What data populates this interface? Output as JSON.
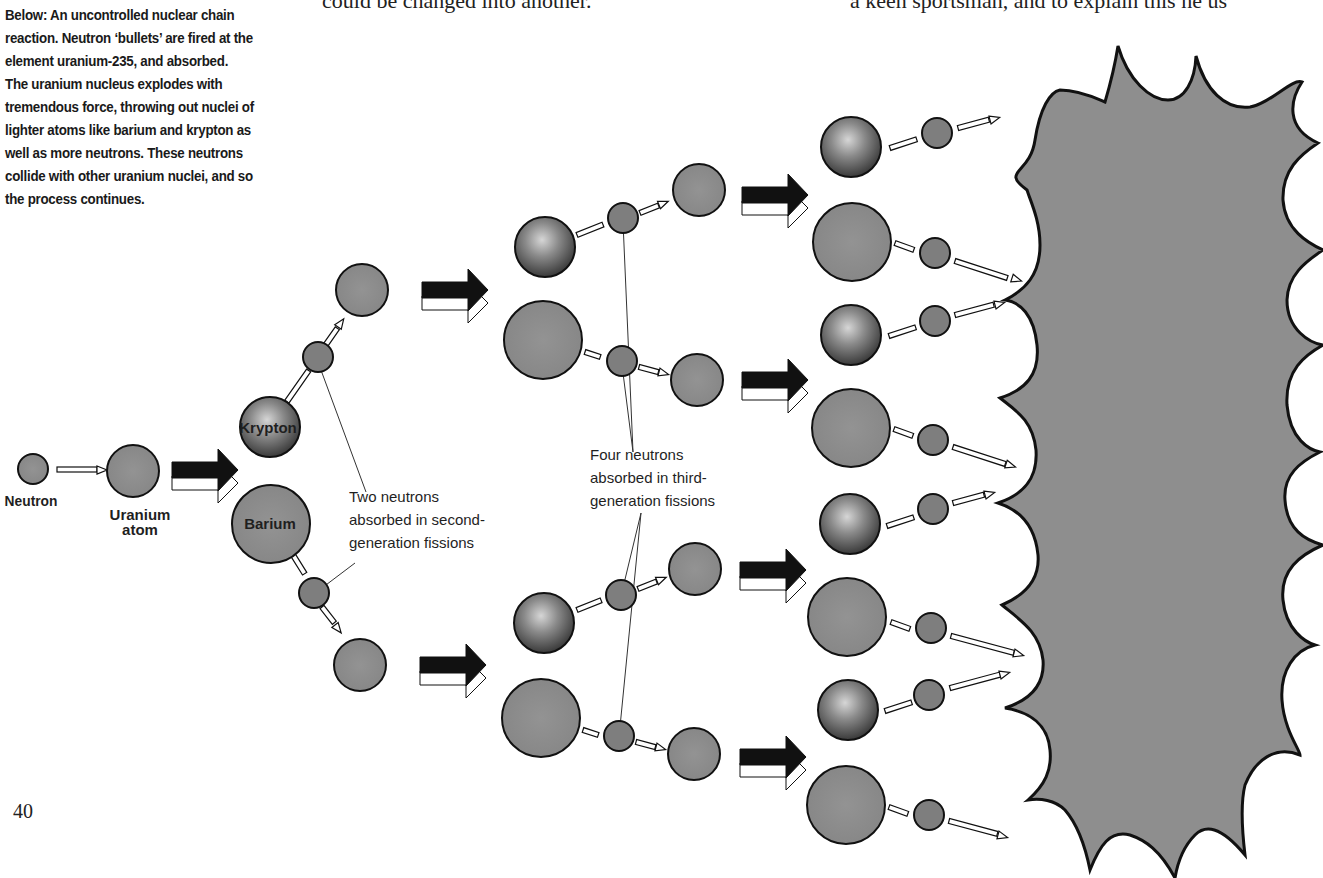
{
  "page": {
    "top_text_left": "could be changed into another.",
    "top_text_right": "a keen sportsman, and to explain this he us",
    "page_number": "40"
  },
  "caption": {
    "text": "Below: An uncontrolled nuclear chain reaction. Neutron ‘bullets’ are fired at the element uranium-235, and absorbed. The uranium nucleus explodes with tremendous force, throwing out nuclei of lighter atoms like barium and krypton as well as more neutrons. These neutrons collide with other uranium nuclei, and so the process continues."
  },
  "labels": {
    "neutron": "Neutron",
    "uranium_line1": "Uranium",
    "uranium_line2": "atom",
    "krypton": "Krypton",
    "barium": "Barium",
    "second_gen_line1": "Two neutrons",
    "second_gen_line2": "absorbed in second-",
    "second_gen_line3": "generation fissions",
    "third_gen_line1": "Four neutrons",
    "third_gen_line2": "absorbed in third-",
    "third_gen_line3": "generation fissions"
  },
  "colors": {
    "nucleus_fill": "#8c8c8c",
    "neutron_fill": "#7e7e7e",
    "outline": "#1a1a1a",
    "big_arrow": "#111111",
    "explosion_fill": "#8e8e8e",
    "background": "#ffffff"
  },
  "diagram": {
    "generation_1": {
      "neutron": {
        "cx": 33,
        "cy": 469,
        "r": 15
      },
      "uranium": {
        "cx": 133,
        "cy": 471,
        "r": 26
      },
      "arrow": {
        "x1": 57,
        "y1": 470,
        "x2": 106,
        "y2": 472
      }
    },
    "generation_2": {
      "krypton": {
        "cx": 270,
        "cy": 427,
        "r": 30
      },
      "barium": {
        "cx": 271,
        "cy": 524,
        "r": 39
      },
      "neutrons": [
        {
          "cx": 318,
          "cy": 357,
          "r": 15
        },
        {
          "cx": 314,
          "cy": 593,
          "r": 15
        }
      ],
      "uraniums": [
        {
          "cx": 362,
          "cy": 290,
          "r": 26
        },
        {
          "cx": 360,
          "cy": 665,
          "r": 26
        }
      ]
    },
    "generation_3": {
      "kryptons": [
        {
          "cx": 545,
          "cy": 247,
          "r": 30
        },
        {
          "cx": 544,
          "cy": 623,
          "r": 30
        }
      ],
      "bariums": [
        {
          "cx": 543,
          "cy": 340,
          "r": 39
        },
        {
          "cx": 541,
          "cy": 718,
          "r": 39
        }
      ],
      "neutrons": [
        {
          "cx": 623,
          "cy": 218,
          "r": 15
        },
        {
          "cx": 622,
          "cy": 361,
          "r": 15
        },
        {
          "cx": 621,
          "cy": 595,
          "r": 15
        },
        {
          "cx": 619,
          "cy": 736,
          "r": 15
        }
      ],
      "uraniums": [
        {
          "cx": 699,
          "cy": 190,
          "r": 26
        },
        {
          "cx": 697,
          "cy": 380,
          "r": 26
        },
        {
          "cx": 695,
          "cy": 569,
          "r": 26
        },
        {
          "cx": 694,
          "cy": 754,
          "r": 26
        }
      ]
    },
    "generation_4": {
      "kryptons": [
        {
          "cx": 851,
          "cy": 147,
          "r": 30
        },
        {
          "cx": 851,
          "cy": 335,
          "r": 30
        },
        {
          "cx": 850,
          "cy": 524,
          "r": 30
        },
        {
          "cx": 848,
          "cy": 710,
          "r": 30
        }
      ],
      "bariums": [
        {
          "cx": 852,
          "cy": 242,
          "r": 39
        },
        {
          "cx": 851,
          "cy": 428,
          "r": 39
        },
        {
          "cx": 847,
          "cy": 617,
          "r": 39
        },
        {
          "cx": 846,
          "cy": 805,
          "r": 39
        }
      ],
      "neutrons": [
        {
          "cx": 937,
          "cy": 133,
          "r": 15
        },
        {
          "cx": 935,
          "cy": 253,
          "r": 15
        },
        {
          "cx": 935,
          "cy": 321,
          "r": 15
        },
        {
          "cx": 933,
          "cy": 440,
          "r": 15
        },
        {
          "cx": 933,
          "cy": 509,
          "r": 15
        },
        {
          "cx": 931,
          "cy": 628,
          "r": 15
        },
        {
          "cx": 929,
          "cy": 695,
          "r": 15
        },
        {
          "cx": 929,
          "cy": 815,
          "r": 15
        }
      ]
    },
    "big_arrows": [
      {
        "x": 172,
        "y": 470
      },
      {
        "x": 422,
        "y": 290
      },
      {
        "x": 420,
        "y": 665
      },
      {
        "x": 742,
        "y": 195
      },
      {
        "x": 742,
        "y": 380
      },
      {
        "x": 740,
        "y": 570
      },
      {
        "x": 740,
        "y": 757
      }
    ]
  }
}
